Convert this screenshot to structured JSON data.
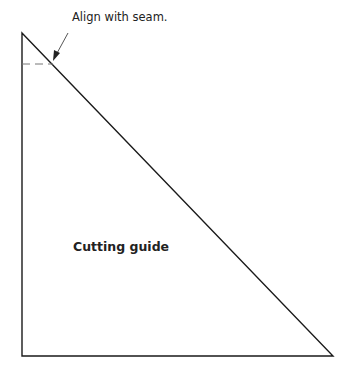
{
  "diagram": {
    "title": "Cutting guide",
    "annotation": "Align with seam.",
    "shape": "right-triangle",
    "colors": {
      "stroke": "#1a1a1a",
      "dash": "#777777",
      "background": "#ffffff"
    }
  }
}
